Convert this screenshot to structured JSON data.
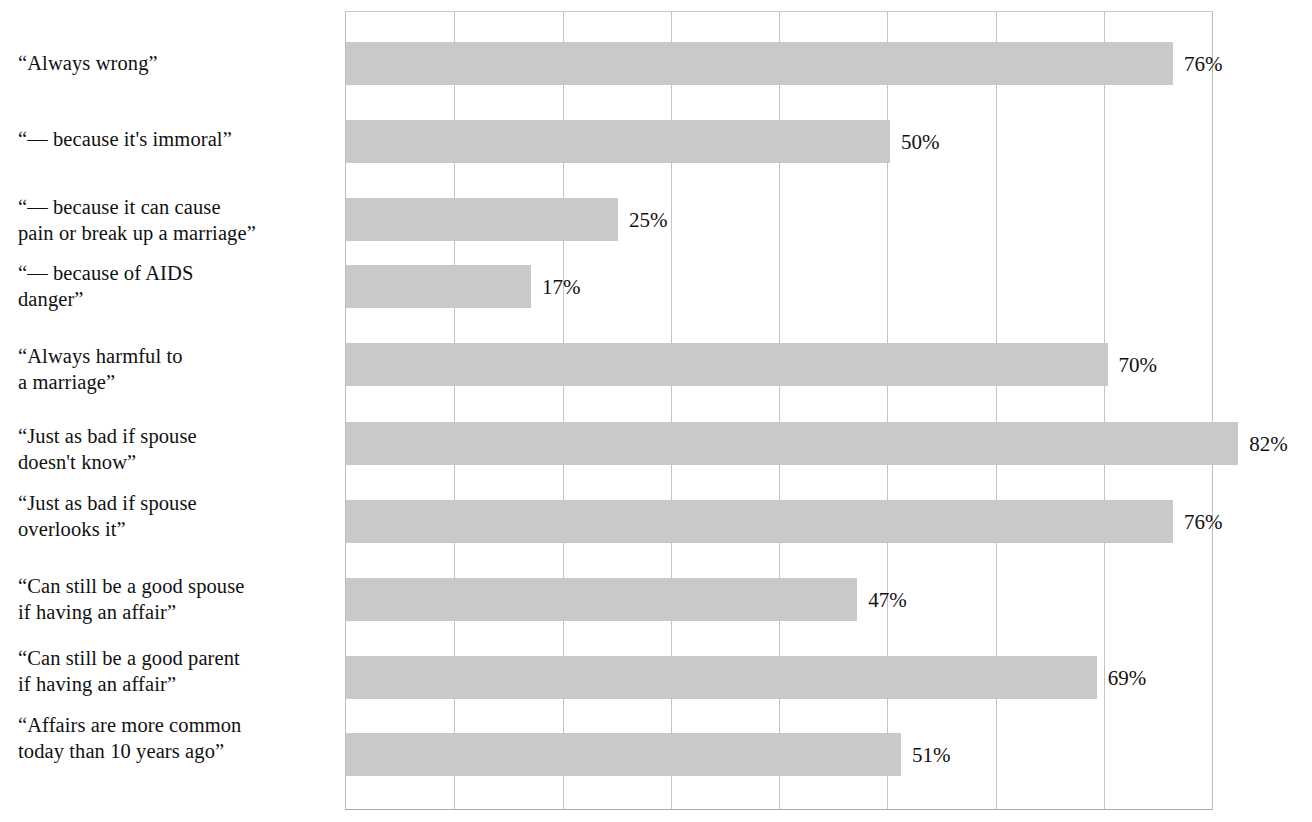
{
  "chart_data": {
    "type": "bar",
    "orientation": "horizontal",
    "title": "",
    "subtitle": "",
    "xlabel": "",
    "ylabel": "",
    "xlim": [
      0,
      80
    ],
    "grid": true,
    "grid_axis": "x",
    "grid_interval": 10,
    "legend": false,
    "value_label_suffix": "%",
    "bar_color": "#c9c9c9",
    "grid_color": "#c4c4c4",
    "axis_color": "#bdbdbd",
    "text_color": "#111111",
    "categories": [
      "“Always wrong”",
      "“— because it's immoral”",
      "“— because it can cause\npain or break up a marriage”",
      "“— because of AIDS\ndanger”",
      "“Always harmful to\na marriage”",
      "“Just as bad if spouse\ndoesn't know”",
      "“Just as bad if spouse\noverlooks it”",
      "“Can still be a good spouse\nif having an affair”",
      "“Can still be a good parent\nif having an affair”",
      "“Affairs are more common\ntoday than 10 years ago”"
    ],
    "values": [
      76,
      50,
      25,
      17,
      70,
      82,
      76,
      47,
      69,
      51
    ],
    "value_labels": [
      "76%",
      "50%",
      "25%",
      "17%",
      "70%",
      "82%",
      "76%",
      "47%",
      "69%",
      "51%"
    ],
    "tick_values": [
      0,
      10,
      20,
      30,
      40,
      50,
      60,
      70,
      80
    ],
    "tick_labels": [
      "",
      "",
      "",
      "",
      "",
      "",
      "",
      "",
      ""
    ]
  },
  "bars": [
    {
      "label": "“Always wrong”",
      "value": 76,
      "value_label": "76%",
      "label_top": 50,
      "label_lines": 1,
      "bar_top": 42,
      "bar_height": 43
    },
    {
      "label": "“— because it's immoral”",
      "value": 50,
      "value_label": "50%",
      "label_top": 126,
      "label_lines": 1,
      "bar_top": 120,
      "bar_height": 43
    },
    {
      "label": "“— because it can cause\npain or break up a marriage”",
      "value": 25,
      "value_label": "25%",
      "label_top": 194,
      "label_lines": 2,
      "bar_top": 198,
      "bar_height": 43
    },
    {
      "label": "“— because of AIDS\ndanger”",
      "value": 17,
      "value_label": "17%",
      "label_top": 260,
      "label_lines": 2,
      "bar_top": 265,
      "bar_height": 43
    },
    {
      "label": "“Always harmful to\na marriage”",
      "value": 70,
      "value_label": "70%",
      "label_top": 343,
      "label_lines": 2,
      "bar_top": 343,
      "bar_height": 43
    },
    {
      "label": "“Just as bad if spouse\ndoesn't know”",
      "value": 82,
      "value_label": "82%",
      "label_top": 423,
      "label_lines": 2,
      "bar_top": 422,
      "bar_height": 43
    },
    {
      "label": "“Just as bad if spouse\noverlooks it”",
      "value": 76,
      "value_label": "76%",
      "label_top": 490,
      "label_lines": 2,
      "bar_top": 500,
      "bar_height": 43
    },
    {
      "label": "“Can still be a good spouse\nif having an affair”",
      "value": 47,
      "value_label": "47%",
      "label_top": 573,
      "label_lines": 2,
      "bar_top": 578,
      "bar_height": 43
    },
    {
      "label": "“Can still be a good parent\nif having an affair”",
      "value": 69,
      "value_label": "69%",
      "label_top": 645,
      "label_lines": 2,
      "bar_top": 656,
      "bar_height": 43
    },
    {
      "label": "“Affairs are more common\ntoday than 10 years ago”",
      "value": 51,
      "value_label": "51%",
      "label_top": 712,
      "label_lines": 2,
      "bar_top": 733,
      "bar_height": 43
    }
  ],
  "plot": {
    "left": 345,
    "top": 11,
    "width": 868,
    "height": 799,
    "scale_px_per_percent": 10.88,
    "gridline_count": 9
  }
}
